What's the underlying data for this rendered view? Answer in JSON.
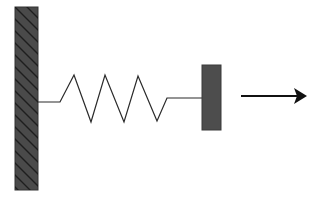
{
  "diagram": {
    "type": "spring-mass-system",
    "colors": {
      "background": "#ffffff",
      "wall_fill": "#4a4a4a",
      "wall_hatch": "#1e1e1e",
      "block_fill": "#4d4d4d",
      "line": "#2a2a2a",
      "arrow": "#111111"
    },
    "elements": [
      {
        "id": "wall",
        "kind": "fixed-support",
        "hatched": true
      },
      {
        "id": "spring",
        "kind": "spring",
        "coils": 3
      },
      {
        "id": "block",
        "kind": "mass"
      },
      {
        "id": "arrow",
        "kind": "direction-arrow",
        "direction": "right"
      }
    ]
  }
}
